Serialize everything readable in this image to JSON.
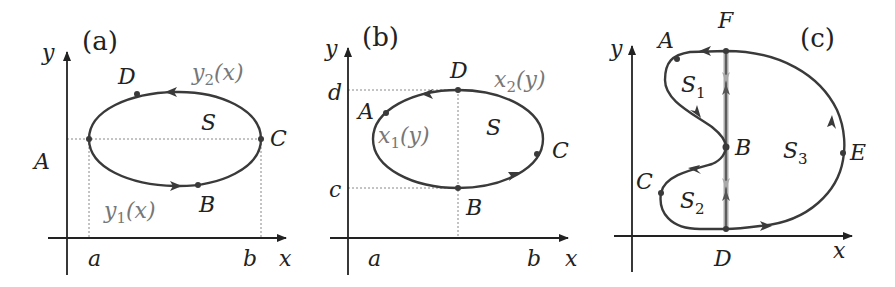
{
  "figure": {
    "colors": {
      "curve": "#3a3a3a",
      "axis": "#222222",
      "guide": "#888888",
      "cut": "#aaaaaa",
      "function_label": "#777777"
    }
  },
  "panels": {
    "a": {
      "tag": "(a)",
      "axis_x": "x",
      "axis_y": "y",
      "tick_a": "a",
      "tick_b": "b",
      "point_A": "A",
      "point_B": "B",
      "point_C": "C",
      "point_D": "D",
      "region": "S",
      "upper_fn_main": "y",
      "upper_fn_sub": "2",
      "upper_fn_arg": "(x)",
      "lower_fn_main": "y",
      "lower_fn_sub": "1",
      "lower_fn_arg": "(x)"
    },
    "b": {
      "tag": "(b)",
      "axis_x": "x",
      "axis_y": "y",
      "tick_a": "a",
      "tick_b": "b",
      "tick_c": "c",
      "tick_d": "d",
      "point_A": "A",
      "point_B": "B",
      "point_C": "C",
      "point_D": "D",
      "region": "S",
      "left_fn_main": "x",
      "left_fn_sub": "1",
      "left_fn_arg": "(y)",
      "right_fn_main": "x",
      "right_fn_sub": "2",
      "right_fn_arg": "(y)"
    },
    "c": {
      "tag": "(c)",
      "axis_x": "x",
      "axis_y": "y",
      "point_A": "A",
      "point_B": "B",
      "point_C": "C",
      "point_D": "D",
      "point_E": "E",
      "point_F": "F",
      "region1_main": "S",
      "region1_sub": "1",
      "region2_main": "S",
      "region2_sub": "2",
      "region3_main": "S",
      "region3_sub": "3"
    }
  }
}
